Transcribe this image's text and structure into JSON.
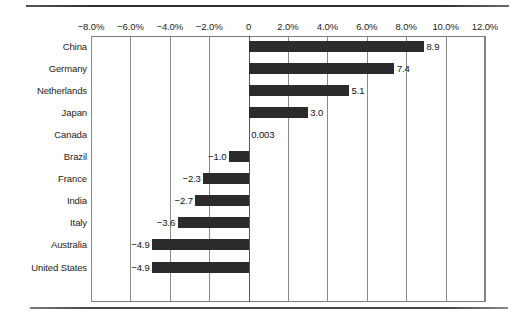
{
  "chart_data": {
    "type": "bar",
    "orientation": "horizontal",
    "title": "",
    "subtitle": "",
    "xlabel": "",
    "ylabel": "",
    "categories": [
      "China",
      "Germany",
      "Netherlands",
      "Japan",
      "Canada",
      "Brazil",
      "France",
      "India",
      "Italy",
      "Australia",
      "United States"
    ],
    "values": [
      8.9,
      7.4,
      5.1,
      3.0,
      0.003,
      -1.0,
      -2.3,
      -2.7,
      -3.6,
      -4.9,
      -4.9
    ],
    "data_labels": [
      "8.9",
      "7.4",
      "5.1",
      "3.0",
      "0.003",
      "−1.0",
      "−2.3",
      "−2.7",
      "−3.6",
      "−4.9",
      "−4.9"
    ],
    "xlim": [
      -8.0,
      12.0
    ],
    "xticks": [
      -8.0,
      -6.0,
      -4.0,
      -2.0,
      0,
      2.0,
      4.0,
      6.0,
      8.0,
      10.0,
      12.0
    ],
    "xticklabels": [
      "−8.0%",
      "−6.0%",
      "−4.0%",
      "−2.0%",
      "0",
      "2.0%",
      "4.0%",
      "6.0%",
      "8.0%",
      "10.0%",
      "12.0%"
    ],
    "grid": true,
    "grid_axis": "x",
    "legend": null,
    "bar_color": "#2b2b2b",
    "axis_color": "#7c7c7c"
  }
}
